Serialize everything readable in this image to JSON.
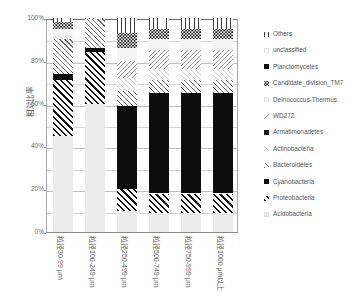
{
  "chart_data": {
    "type": "bar",
    "subtype": "stacked-percentage",
    "title": "",
    "xlabel": "",
    "ylabel": "相対比率",
    "ylim": [
      0,
      100
    ],
    "ytick_labels": [
      "100%",
      "80%",
      "60%",
      "40%",
      "20%",
      "0%"
    ],
    "ytick_values": [
      100,
      80,
      60,
      40,
      20,
      0
    ],
    "minor_gridlines_every": 10,
    "grid": true,
    "legend_position": "right",
    "categories": [
      "粒径30-99 μm",
      "粒径100-249 μm",
      "粒径250-499 μm",
      "粒径500-749 μm",
      "粒径750-999 μm",
      "粒径1000 μm以上"
    ],
    "series": [
      {
        "name": "Acidobacteria",
        "pattern": "light-gray-solid",
        "values": [
          45.0,
          60.0,
          10.0,
          9.0,
          9.0,
          9.0
        ]
      },
      {
        "name": "Proteobacteria",
        "pattern": "diagonal-hatch-black",
        "values": [
          26.0,
          24.0,
          10.0,
          9.0,
          9.0,
          9.0
        ]
      },
      {
        "name": "Cyanobacteria",
        "pattern": "solid-black",
        "values": [
          3.0,
          2.0,
          39.0,
          47.0,
          47.0,
          47.0
        ]
      },
      {
        "name": "Bacteroidetes",
        "pattern": "diagonal-hatch-gray",
        "values": [
          16.0,
          13.5,
          7.0,
          6.0,
          6.0,
          6.0
        ]
      },
      {
        "name": "Actinobacteria",
        "pattern": "diagonal-hatch-light",
        "values": [
          1.5,
          0.0,
          6.0,
          5.0,
          5.0,
          5.0
        ]
      },
      {
        "name": "Armatimonadetes",
        "pattern": "solid-black",
        "values": [
          0.0,
          0.0,
          0.0,
          0.0,
          0.0,
          0.0
        ]
      },
      {
        "name": "WD272",
        "pattern": "diagonal-hatch-fine",
        "values": [
          0.0,
          0.0,
          8.0,
          9.0,
          9.0,
          9.0
        ]
      },
      {
        "name": "Deinococcus-Thermus",
        "pattern": "very-light",
        "values": [
          3.5,
          0.0,
          6.0,
          5.0,
          5.0,
          5.0
        ]
      },
      {
        "name": "Candidate_division_TM7",
        "pattern": "dotted",
        "values": [
          3.0,
          0.0,
          7.0,
          5.0,
          5.0,
          5.0
        ]
      },
      {
        "name": "unclassified",
        "pattern": "near-white",
        "values": [
          0.0,
          0.0,
          0.0,
          0.0,
          0.0,
          0.0
        ]
      },
      {
        "name": "Others",
        "pattern": "vertical-lines",
        "values": [
          2.0,
          0.5,
          7.0,
          5.0,
          5.0,
          5.0
        ]
      }
    ]
  },
  "axis": {
    "y_title": "相対比率",
    "y_ticks": [
      "100%",
      "80%",
      "60%",
      "40%",
      "20%",
      "0%"
    ]
  },
  "legend": {
    "items": [
      {
        "label": "Others",
        "key": "others"
      },
      {
        "label": "unclassified",
        "key": "unclass"
      },
      {
        "label": "Planctomycetes",
        "key": "planc"
      },
      {
        "label": "Candidate_division_TM7",
        "key": "tm7"
      },
      {
        "label": "Deinococcus-Thermus",
        "key": "deino"
      },
      {
        "label": "WD272",
        "key": "wd272"
      },
      {
        "label": "Armatimonadetes",
        "key": "armati"
      },
      {
        "label": "Actinobacteria",
        "key": "actino"
      },
      {
        "label": "Bacteroidetes",
        "key": "bacteroid"
      },
      {
        "label": "Cyanobacteria",
        "key": "cyano"
      },
      {
        "label": "Proteobacteria",
        "key": "proteo"
      },
      {
        "label": "Acidobacteria",
        "key": "acido"
      }
    ]
  }
}
